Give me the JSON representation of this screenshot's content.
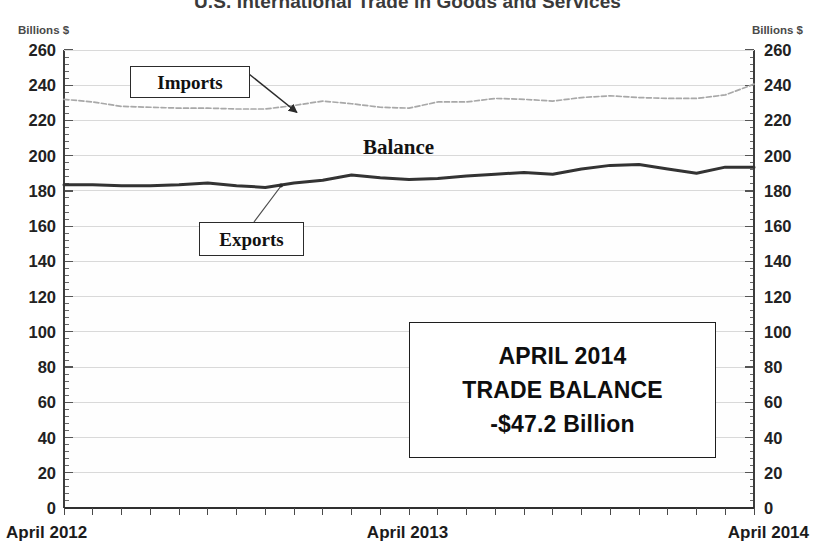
{
  "chart_data": {
    "type": "line",
    "title": "U.S. International Trade in Goods and Services",
    "xlabel": "",
    "ylabel": "Billions $",
    "ylim": [
      0,
      260
    ],
    "ytick_step": 20,
    "grid": true,
    "legend_position": "inline-annotations",
    "axis_unit_left": "Billions $",
    "axis_unit_right": "Billions $",
    "yticks": [
      260,
      240,
      220,
      200,
      180,
      160,
      140,
      120,
      100,
      80,
      60,
      40,
      20,
      0
    ],
    "xticks": [
      "April 2012",
      "April 2013",
      "April 2014"
    ],
    "x": [
      "Apr 2012",
      "May 2012",
      "Jun 2012",
      "Jul 2012",
      "Aug 2012",
      "Sep 2012",
      "Oct 2012",
      "Nov 2012",
      "Dec 2012",
      "Jan 2013",
      "Feb 2013",
      "Mar 2013",
      "Apr 2013",
      "May 2013",
      "Jun 2013",
      "Jul 2013",
      "Aug 2013",
      "Sep 2013",
      "Oct 2013",
      "Nov 2013",
      "Dec 2013",
      "Jan 2014",
      "Feb 2014",
      "Mar 2014",
      "Apr 2014"
    ],
    "series": [
      {
        "name": "Imports",
        "style": "thin-gray-line",
        "color": "#a8a8a8",
        "values": [
          232.0,
          230.5,
          228.0,
          227.5,
          227.0,
          227.0,
          226.5,
          226.5,
          228.5,
          231.0,
          229.5,
          227.5,
          227.0,
          230.5,
          230.5,
          232.5,
          232.0,
          231.0,
          233.0,
          234.0,
          233.0,
          232.5,
          232.5,
          234.5,
          240.6
        ]
      },
      {
        "name": "Exports",
        "style": "thick-dark-line",
        "color": "#333333",
        "values": [
          183.5,
          183.5,
          183.0,
          183.0,
          183.5,
          184.5,
          183.0,
          182.0,
          184.5,
          186.0,
          189.0,
          187.5,
          186.5,
          187.0,
          188.5,
          189.5,
          190.5,
          189.5,
          192.5,
          194.5,
          195.0,
          192.5,
          190.0,
          193.5,
          193.5
        ]
      }
    ],
    "annotations": [
      {
        "name": "Imports",
        "kind": "boxed-leader-label"
      },
      {
        "name": "Balance",
        "kind": "plain-label"
      },
      {
        "name": "Exports",
        "kind": "boxed-leader-label"
      }
    ]
  },
  "title": "U.S. International Trade in Goods and Services",
  "axis": {
    "unit_left": "Billions $",
    "unit_right": "Billions $",
    "y_ticks": [
      "260",
      "240",
      "220",
      "200",
      "180",
      "160",
      "140",
      "120",
      "100",
      "80",
      "60",
      "40",
      "20",
      "0"
    ],
    "x_start": "April 2012",
    "x_mid": "April 2013",
    "x_end": "April  2014"
  },
  "labels": {
    "imports": "Imports",
    "balance": "Balance",
    "exports": "Exports"
  },
  "summary": {
    "line1": "APRIL 2014",
    "line2": "TRADE BALANCE",
    "line3": "-$47.2 Billion"
  },
  "colors": {
    "imports_line": "#a8a8a8",
    "exports_line": "#333333",
    "grid": "#d9d9d9",
    "axis": "#555555",
    "text": "#1b1b1b",
    "title": "#3a3a3a"
  }
}
